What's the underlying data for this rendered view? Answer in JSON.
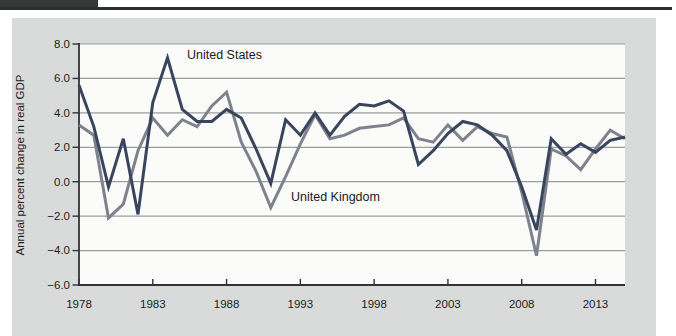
{
  "figure": {
    "colors": {
      "tab": "#353a39",
      "rule": "#2c3130",
      "panel_bg": "#d9dbda",
      "plot_bg": "#fbfbf9",
      "grid": "#999e9f",
      "axis": "#303335",
      "text": "#1c1c1c"
    }
  },
  "chart_data": {
    "type": "line",
    "title": "",
    "xlabel": "",
    "ylabel": "Annual percent change in real GDP",
    "ylim": [
      -6,
      8
    ],
    "y_tick_values": [
      8,
      6,
      4,
      2,
      0,
      -2,
      -4,
      -6
    ],
    "y_tick_labels": [
      "8.0",
      "6.0",
      "4.0",
      "2.0",
      "0.0",
      "−2.0",
      "−4.0",
      "−6.0"
    ],
    "x_tick_values": [
      1978,
      1983,
      1988,
      1993,
      1998,
      2003,
      2008,
      2013
    ],
    "x_tick_labels": [
      "1978",
      "1983",
      "1988",
      "1993",
      "1998",
      "2003",
      "2008",
      "2013"
    ],
    "grid": "horizontal",
    "legend_position": "inline-annotations",
    "x": [
      1978,
      1979,
      1980,
      1981,
      1982,
      1983,
      1984,
      1985,
      1986,
      1987,
      1988,
      1989,
      1990,
      1991,
      1992,
      1993,
      1994,
      1995,
      1996,
      1997,
      1998,
      1999,
      2000,
      2001,
      2002,
      2003,
      2004,
      2005,
      2006,
      2007,
      2008,
      2009,
      2010,
      2011,
      2012,
      2013,
      2014,
      2015
    ],
    "series": [
      {
        "name": "United Kingdom",
        "color": "#7d828d",
        "values": [
          3.3,
          2.7,
          -2.1,
          -1.3,
          1.8,
          3.7,
          2.7,
          3.6,
          3.2,
          4.4,
          5.2,
          2.3,
          0.6,
          -1.5,
          0.3,
          2.2,
          3.9,
          2.5,
          2.7,
          3.1,
          3.2,
          3.3,
          3.7,
          2.5,
          2.3,
          3.3,
          2.4,
          3.2,
          2.8,
          2.6,
          -0.6,
          -4.3,
          1.9,
          1.5,
          0.7,
          1.9,
          3.0,
          2.5
        ]
      },
      {
        "name": "United States",
        "color": "#39445d",
        "values": [
          5.6,
          3.2,
          -0.3,
          2.5,
          -1.9,
          4.6,
          7.2,
          4.2,
          3.5,
          3.5,
          4.2,
          3.7,
          1.9,
          -0.1,
          3.6,
          2.7,
          4.0,
          2.7,
          3.8,
          4.5,
          4.4,
          4.7,
          4.1,
          1.0,
          1.8,
          2.8,
          3.5,
          3.3,
          2.7,
          1.8,
          -0.3,
          -2.8,
          2.5,
          1.6,
          2.2,
          1.7,
          2.4,
          2.6
        ]
      }
    ],
    "annotations": [
      {
        "text": "United States",
        "year": 1985.3,
        "value": 7.35
      },
      {
        "text": "United Kingdom",
        "year": 1992.35,
        "value": -0.9
      }
    ]
  }
}
